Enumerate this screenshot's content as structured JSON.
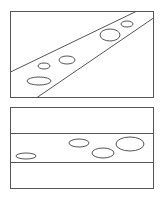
{
  "colors": {
    "background": "#ffffff",
    "line": "#555555"
  },
  "panels": [
    {
      "id": "top-panel",
      "description": "Diagonal band with ellipses",
      "frame": {
        "x": 10.5,
        "y": 11.5,
        "w": 143,
        "h": 86
      },
      "lines": [
        {
          "x1": 10.5,
          "y1": 72,
          "x2": 136,
          "y2": 11.5
        },
        {
          "x1": 37,
          "y1": 97.5,
          "x2": 153.5,
          "y2": 18
        }
      ],
      "ellipses": [
        {
          "cx": 39,
          "cy": 81,
          "rx": 12,
          "ry": 4
        },
        {
          "cx": 44,
          "cy": 66,
          "rx": 6,
          "ry": 3
        },
        {
          "cx": 67,
          "cy": 60,
          "rx": 8,
          "ry": 4
        },
        {
          "cx": 110,
          "cy": 35,
          "rx": 10,
          "ry": 6
        },
        {
          "cx": 127,
          "cy": 24,
          "rx": 6,
          "ry": 3
        }
      ]
    },
    {
      "id": "bottom-panel",
      "description": "Horizontal band with ellipses",
      "frame": {
        "x": 10.5,
        "y": 107.5,
        "w": 143,
        "h": 81
      },
      "lines": [
        {
          "x1": 10.5,
          "y1": 133.5,
          "x2": 153.5,
          "y2": 133.5
        },
        {
          "x1": 10.5,
          "y1": 162.5,
          "x2": 153.5,
          "y2": 162.5
        }
      ],
      "ellipses": [
        {
          "cx": 26,
          "cy": 156,
          "rx": 10,
          "ry": 3
        },
        {
          "cx": 79,
          "cy": 143,
          "rx": 10,
          "ry": 4
        },
        {
          "cx": 103,
          "cy": 153,
          "rx": 11,
          "ry": 5
        },
        {
          "cx": 130,
          "cy": 144,
          "rx": 14,
          "ry": 7
        }
      ]
    }
  ]
}
